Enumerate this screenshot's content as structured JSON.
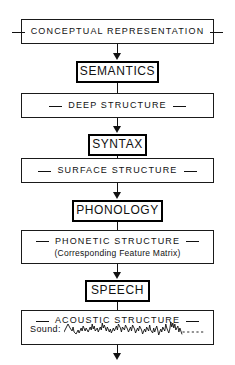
{
  "diagram": {
    "line_color": "#111111",
    "background": "#ffffff",
    "levels": [
      {
        "id": "conceptual-representation",
        "kind": "level",
        "label": "CONCEPTUAL  REPRESENTATION",
        "flank": "dash"
      },
      {
        "id": "semantics",
        "kind": "stage",
        "label": "SEMANTICS"
      },
      {
        "id": "deep-structure",
        "kind": "level",
        "label": "DEEP  STRUCTURE",
        "flank": "dash"
      },
      {
        "id": "syntax",
        "kind": "stage",
        "label": "SYNTAX"
      },
      {
        "id": "surface-structure",
        "kind": "level",
        "label": "SURFACE  STRUCTURE",
        "flank": "dash"
      },
      {
        "id": "phonology",
        "kind": "stage",
        "label": "PHONOLOGY"
      },
      {
        "id": "phonetic-structure",
        "kind": "level",
        "label": "PHONETIC  STRUCTURE",
        "sublabel": "(Corresponding Feature Matrix)",
        "flank": "dash"
      },
      {
        "id": "speech",
        "kind": "stage",
        "label": "SPEECH"
      },
      {
        "id": "acoustic-structure",
        "kind": "level",
        "label": "ACOUSTIC  STRUCTURE",
        "flank": "dash"
      }
    ],
    "sound": {
      "caption": "Sound:",
      "trailing_style": "dotted"
    },
    "arrows": {
      "count": 9,
      "direction": "down"
    }
  }
}
